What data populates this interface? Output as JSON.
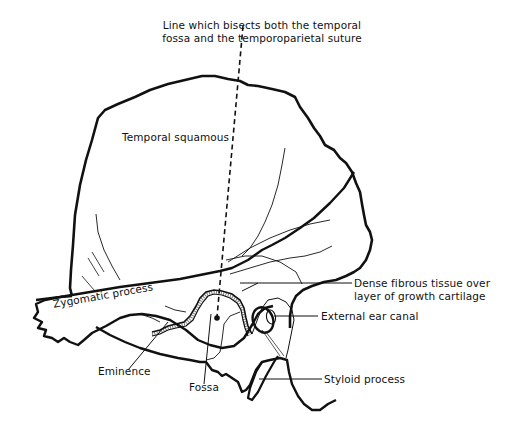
{
  "diagram": {
    "labels": {
      "bisect_line_line1": "Line which bisects both the temporal",
      "bisect_line_line2": "fossa and the temporoparietal suture",
      "temporal_squamous": "Temporal squamous",
      "dense_fibrous_line1": "Dense fibrous tissue over",
      "dense_fibrous_line2": "layer of growth cartilage",
      "zygomatic_process": "Zygomatic process",
      "external_ear_canal": "External ear canal",
      "eminence": "Eminence",
      "fossa": "Fossa",
      "styloid_process": "Styloid process"
    },
    "colors": {
      "line": "#111111",
      "background": "#ffffff"
    }
  }
}
